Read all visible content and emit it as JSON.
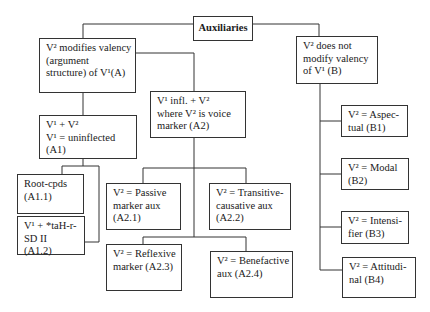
{
  "diagram": {
    "title": "Auxiliaries",
    "nodes": {
      "root": {
        "label": "Auxiliaries"
      },
      "A": {
        "lines": [
          "V² modifies valency",
          "(argument",
          "structure) of V¹(A)"
        ]
      },
      "B": {
        "lines": [
          "V² does not",
          "modify valency",
          "of V¹ (B)"
        ]
      },
      "A1": {
        "lines": [
          "V¹ + V²",
          "V¹ = uninflected",
          "(A1)"
        ]
      },
      "A2": {
        "lines": [
          "V¹ infl. + V²",
          "where V² is voice",
          "marker (A2)"
        ]
      },
      "A1_1": {
        "lines": [
          "Root-cpds",
          "(A1.1)"
        ]
      },
      "A1_2": {
        "lines": [
          "V¹ + *taH-r-",
          "SD II",
          "(A1.2)"
        ]
      },
      "A2_1": {
        "lines": [
          "V² = Passive",
          "marker aux",
          "(A2.1)"
        ]
      },
      "A2_2": {
        "lines": [
          "V² = Transitive-",
          "causative aux",
          "(A2.2)"
        ]
      },
      "A2_3": {
        "lines": [
          "V² = Reflexive",
          "marker (A2.3)"
        ]
      },
      "A2_4": {
        "lines": [
          "V² = Benefactive",
          "aux (A2.4)"
        ]
      },
      "B1": {
        "lines": [
          "V² = Aspec-",
          "tual (B1)"
        ]
      },
      "B2": {
        "lines": [
          "V² = Modal",
          "(B2)"
        ]
      },
      "B3": {
        "lines": [
          "V² = Intensi-",
          "fier (B3)"
        ]
      },
      "B4": {
        "lines": [
          "V² = Attitudi-",
          "nal (B4)"
        ]
      }
    },
    "edges": [
      [
        "root",
        "A"
      ],
      [
        "root",
        "B"
      ],
      [
        "A",
        "A1"
      ],
      [
        "A",
        "A2"
      ],
      [
        "A1",
        "A1_1"
      ],
      [
        "A1",
        "A1_2"
      ],
      [
        "A2",
        "A2_1"
      ],
      [
        "A2",
        "A2_2"
      ],
      [
        "A2",
        "A2_3"
      ],
      [
        "A2",
        "A2_4"
      ],
      [
        "B",
        "B1"
      ],
      [
        "B",
        "B2"
      ],
      [
        "B",
        "B3"
      ],
      [
        "B",
        "B4"
      ]
    ],
    "colors": {
      "stroke": "#333333",
      "background": "#ffffff",
      "text": "#1a1a1a"
    }
  }
}
